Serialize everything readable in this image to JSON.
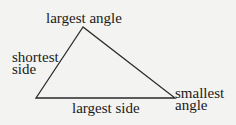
{
  "diagram": {
    "type": "triangle-angle-side-relationship",
    "vertices": {
      "top": [
        83,
        27
      ],
      "left": [
        36,
        98
      ],
      "right": [
        175,
        98
      ]
    },
    "stroke_color": "#2a2a2a",
    "background": "#f3f3f1",
    "labels": {
      "top_vertex": "largest angle",
      "left_side_line1": "shortest",
      "left_side_line2": "side",
      "bottom_side": "largest side",
      "right_vertex_line1": "smallest",
      "right_vertex_line2": "angle"
    }
  }
}
